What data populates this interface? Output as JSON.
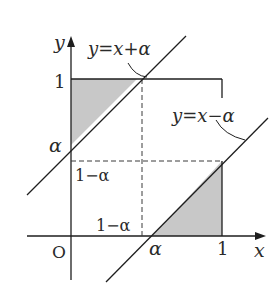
{
  "diagram": {
    "type": "coordinate-region",
    "colors": {
      "stroke": "#1e1e1e",
      "shade": "#c8c8c8",
      "background": "#ffffff"
    },
    "axes": {
      "x_label": "x",
      "y_label": "y",
      "origin_label": "O"
    },
    "ticks": {
      "x_one": "1",
      "y_one": "1",
      "x_alpha": "α",
      "y_alpha": "α",
      "x_one_minus_alpha": "1−α",
      "y_one_minus_alpha": "1−α"
    },
    "lines": {
      "upper": "y=x+α",
      "lower": "y=x−α"
    },
    "regions": [
      {
        "name": "upper-left-triangle",
        "vertices": [
          [
            0,
            "α"
          ],
          [
            0,
            1
          ],
          [
            "1−α",
            1
          ]
        ]
      },
      {
        "name": "lower-right-triangle",
        "vertices": [
          [
            "α",
            0
          ],
          [
            1,
            0
          ],
          [
            1,
            "1−α"
          ]
        ]
      }
    ]
  }
}
